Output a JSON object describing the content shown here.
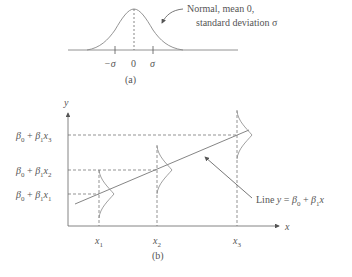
{
  "panel_a": {
    "caption": "(a)",
    "annotation_line1": "Normal, mean 0,",
    "annotation_line2": "standard deviation σ",
    "ticks": {
      "neg_sigma": "−σ",
      "zero": "0",
      "sigma": "σ"
    }
  },
  "panel_b": {
    "caption": "(b)",
    "y_axis_label": "y",
    "x_axis_label": "x",
    "x_ticks": {
      "x1": "x",
      "x1_sub": "1",
      "x2": "x",
      "x2_sub": "2",
      "x3": "x",
      "x3_sub": "3"
    },
    "y_levels": {
      "l3": {
        "b0": "β",
        "b0sub": "0",
        "plus": " + ",
        "b1": "β",
        "b1sub": "1",
        "x": "x",
        "xsub": "3"
      },
      "l2": {
        "b0": "β",
        "b0sub": "0",
        "plus": " + ",
        "b1": "β",
        "b1sub": "1",
        "x": "x",
        "xsub": "2"
      },
      "l1": {
        "b0": "β",
        "b0sub": "0",
        "plus": " + ",
        "b1": "β",
        "b1sub": "1",
        "x": "x",
        "xsub": "1"
      }
    },
    "line_label": {
      "prefix": "Line ",
      "y": "y",
      "eq": " = ",
      "b0": "β",
      "b0sub": "0",
      "plus": " + ",
      "b1": "β",
      "b1sub": "1",
      "x": "x"
    }
  },
  "colors": {
    "stroke": "#7a7a7a",
    "text": "#555555"
  }
}
